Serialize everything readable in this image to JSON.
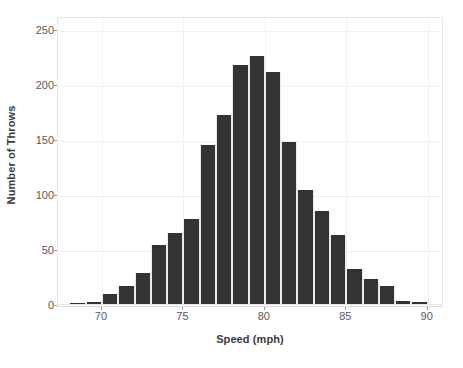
{
  "chart_data": {
    "type": "bar",
    "title": "",
    "subtitle": "",
    "xlabel": "Speed (mph)",
    "ylabel": "Number of Throws",
    "xlim": [
      67.3,
      91.0
    ],
    "ylim": [
      0,
      262
    ],
    "grid": true,
    "legend": null,
    "bin_width": 1,
    "x_ticks": [
      70,
      75,
      80,
      85,
      90
    ],
    "x_tick_labels": [
      "70",
      "75",
      "80",
      "85",
      "90"
    ],
    "y_ticks": [
      0,
      50,
      100,
      150,
      200,
      250
    ],
    "y_tick_labels": [
      "0",
      "50",
      "100",
      "150",
      "200",
      "250"
    ],
    "categories": [
      "68-69",
      "69-70",
      "70-71",
      "71-72",
      "72-73",
      "73-74",
      "74-75",
      "75-76",
      "76-77",
      "77-78",
      "78-79",
      "79-80",
      "80-81",
      "81-82",
      "82-83",
      "83-84",
      "84-85",
      "85-86",
      "86-87",
      "87-88",
      "88-89",
      "89-90"
    ],
    "bin_starts": [
      68,
      69,
      70,
      71,
      72,
      73,
      74,
      75,
      76,
      77,
      78,
      79,
      80,
      81,
      82,
      83,
      84,
      85,
      86,
      87,
      88,
      89
    ],
    "values": [
      1,
      2,
      9,
      16,
      28,
      54,
      65,
      77,
      145,
      172,
      217,
      226,
      211,
      147,
      104,
      85,
      63,
      32,
      23,
      16,
      3,
      2
    ],
    "colors": {
      "bar_fill": "#333333",
      "bar_edge": "#e9e9e9",
      "gridline": "#f0f0f0",
      "frame": "#e6e6e6",
      "tick_text": "#595959",
      "axis_title_text": "#3b3b3b",
      "background": "#ffffff"
    }
  },
  "axes": {
    "y_title": "Number of Throws",
    "x_title": "Speed (mph)"
  }
}
